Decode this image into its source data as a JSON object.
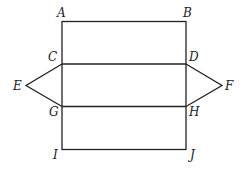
{
  "diagram": {
    "labels": {
      "A": "A",
      "B": "B",
      "C": "C",
      "D": "D",
      "E": "E",
      "F": "F",
      "G": "G",
      "H": "H",
      "I": "I",
      "J": "J"
    },
    "colors": {
      "stroke": "#222222",
      "background": "#ffffff"
    }
  }
}
